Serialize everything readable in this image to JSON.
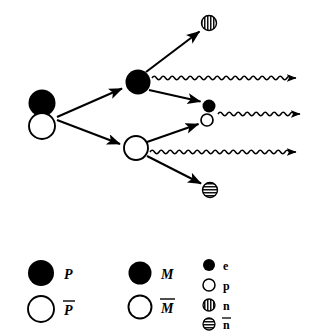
{
  "figure": {
    "background_color": "#ffffff",
    "ink_color": "#000000",
    "width": 310,
    "height": 335
  },
  "diagram": {
    "nodes": [
      {
        "id": "source-pair",
        "name": "initial-P-Pbar-pair",
        "kind": "stacked-pair",
        "top_glyph": "filled-circle",
        "bottom_glyph": "open-circle",
        "top_label": "P",
        "bottom_label": "Pbar",
        "cx": 42,
        "cy_top": 103,
        "cy_bottom": 126,
        "r": 13.5
      },
      {
        "id": "node-M",
        "name": "intermediate-M-node",
        "kind": "filled-circle",
        "label": "M",
        "cx": 138,
        "cy": 82,
        "r": 12.5
      },
      {
        "id": "node-Mbar",
        "name": "intermediate-Mbar-node",
        "kind": "open-circle",
        "label": "Mbar",
        "cx": 136,
        "cy": 148,
        "r": 12.5
      },
      {
        "id": "node-n-top",
        "name": "neutron-product-top",
        "kind": "split-circle",
        "label": "n",
        "cx": 209,
        "cy": 23,
        "r": 7.5
      },
      {
        "id": "node-e",
        "name": "electron-product",
        "kind": "filled-circle",
        "label": "e",
        "cx": 209,
        "cy": 106,
        "r": 6.5
      },
      {
        "id": "node-p",
        "name": "proton-product",
        "kind": "open-circle",
        "label": "p",
        "cx": 207,
        "cy": 120,
        "r": 6.5
      },
      {
        "id": "node-nbar-bottom",
        "name": "antineutron-product-bottom",
        "kind": "striped-circle",
        "label": "nbar",
        "cx": 210,
        "cy": 190,
        "r": 7.5
      }
    ],
    "arrows": [
      {
        "name": "arrow-source-to-M",
        "from": "source-pair",
        "to": "node-M",
        "x1": 57,
        "y1": 117,
        "x2": 123,
        "y2": 88
      },
      {
        "name": "arrow-source-to-Mbar",
        "from": "source-pair",
        "to": "node-Mbar",
        "x1": 57,
        "y1": 120,
        "x2": 121,
        "y2": 144
      },
      {
        "name": "arrow-M-to-n",
        "from": "node-M",
        "to": "node-n-top",
        "x1": 146,
        "y1": 72,
        "x2": 200,
        "y2": 32
      },
      {
        "name": "arrow-M-to-e",
        "from": "node-M",
        "to": "node-e",
        "x1": 149,
        "y1": 90,
        "x2": 201,
        "y2": 102
      },
      {
        "name": "arrow-Mbar-to-p",
        "from": "node-Mbar",
        "to": "node-p",
        "x1": 147,
        "y1": 142,
        "x2": 199,
        "y2": 124
      },
      {
        "name": "arrow-Mbar-to-nbar",
        "from": "node-Mbar",
        "to": "node-nbar-bottom",
        "x1": 147,
        "y1": 156,
        "x2": 201,
        "y2": 184
      }
    ],
    "wavy_lines": [
      {
        "name": "photon-from-M",
        "x1": 152,
        "y1": 78,
        "x2": 305,
        "y2": 78,
        "amplitude": 3.2,
        "wavelength": 9
      },
      {
        "name": "photon-from-e-p",
        "x1": 218,
        "y1": 114,
        "x2": 307,
        "y2": 114,
        "amplitude": 3.2,
        "wavelength": 9
      },
      {
        "name": "photon-from-Mbar",
        "x1": 150,
        "y1": 152,
        "x2": 305,
        "y2": 152,
        "amplitude": 3.2,
        "wavelength": 9
      }
    ]
  },
  "legend": {
    "columns": [
      {
        "name": "legend-column-P",
        "entries": [
          {
            "glyph": "filled-circle",
            "label": "P",
            "style": "bold-italic",
            "overbar": false,
            "r": 13
          },
          {
            "glyph": "open-circle",
            "label": "P",
            "style": "bold-italic",
            "overbar": true,
            "r": 13
          }
        ]
      },
      {
        "name": "legend-column-M",
        "entries": [
          {
            "glyph": "filled-circle",
            "label": "M",
            "style": "bold-italic",
            "overbar": false,
            "r": 11.5
          },
          {
            "glyph": "open-circle",
            "label": "M",
            "style": "bold-italic",
            "overbar": true,
            "r": 11.5
          }
        ]
      },
      {
        "name": "legend-column-particles",
        "entries": [
          {
            "glyph": "filled-circle",
            "label": "e",
            "style": "bold",
            "overbar": false,
            "r": 6
          },
          {
            "glyph": "open-circle",
            "label": "p",
            "style": "bold",
            "overbar": false,
            "r": 6
          },
          {
            "glyph": "split-circle",
            "label": "n",
            "style": "bold",
            "overbar": false,
            "r": 6
          },
          {
            "glyph": "striped-circle",
            "label": "n",
            "style": "bold",
            "overbar": true,
            "r": 6
          }
        ]
      }
    ]
  }
}
